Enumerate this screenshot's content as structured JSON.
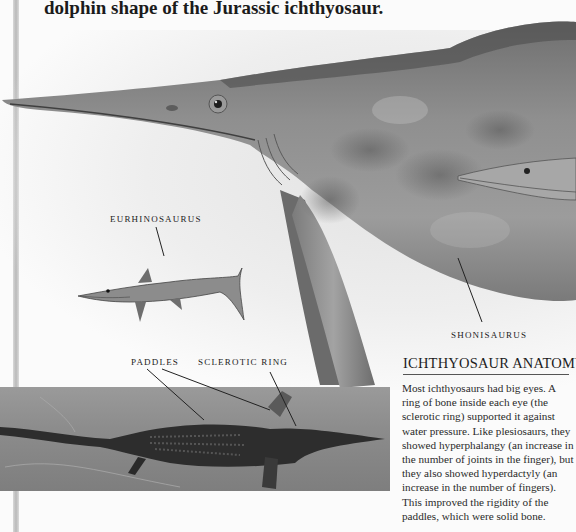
{
  "page": {
    "intro_text": "dolphin shape of the Jurassic ichthyosaur."
  },
  "labels": {
    "eurhinosaurus": "EURHINOSAURUS",
    "shonisaurus": "SHONISAURUS",
    "paddles": "PADDLES",
    "sclerotic_ring": "SCLEROTIC RING"
  },
  "sidebar": {
    "title": "ICHTHYOSAUR ANATOMY",
    "body": "Most ichthyosaurs had big eyes. A ring of bone inside each eye (the sclerotic ring) supported it against water pressure. Like plesiosaurs, they showed hyperphalangy (an increase in the number of joints in the finger), but they also showed hyperdactyly (an increase in the number of fingers). This improved the rigidity of the paddles, which were solid bone."
  },
  "images": {
    "main_illustration": "Shonisaurus illustration",
    "small_illustration": "Eurhinosaurus illustration",
    "fossil_photo": "Ichthyosaur fossil"
  },
  "colors": {
    "background": "#fbfbfb",
    "text": "#1c1c1c",
    "animal_skin": "#8a8a8a",
    "fossil_slab": "#8c8c8c"
  }
}
